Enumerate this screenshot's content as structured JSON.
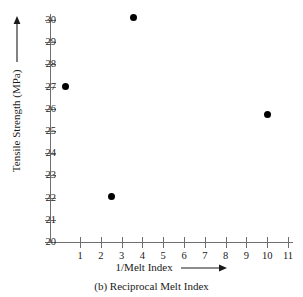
{
  "chart_data": {
    "type": "scatter",
    "title": "",
    "caption": "(b) Reciprocal Melt Index",
    "xlabel": "1/Melt Index",
    "ylabel": "Tensile Strength (MPa)",
    "xlabel_arrow": "right-arrow",
    "ylabel_arrow": "up-arrow",
    "xlim": [
      0,
      11.6
    ],
    "ylim": [
      20,
      30.4
    ],
    "xticks": [
      1,
      2,
      3,
      4,
      5,
      6,
      7,
      8,
      9,
      10,
      11
    ],
    "yticks": [
      20,
      21,
      22,
      23,
      24,
      25,
      26,
      27,
      28,
      29,
      30
    ],
    "xtick_labels": [
      "1",
      "2",
      "3",
      "4",
      "5",
      "6",
      "7",
      "8",
      "9",
      "10",
      "11"
    ],
    "ytick_labels": [
      "20",
      "21",
      "22",
      "23",
      "24",
      "25",
      "26",
      "27",
      "28",
      "29",
      "30"
    ],
    "grid": false,
    "legend": false,
    "marker": "filled-circle",
    "marker_color": "#000000",
    "axis_color": "#6f6f6f",
    "points": [
      {
        "x": 0.3,
        "y": 27.0
      },
      {
        "x": 2.5,
        "y": 22.05
      },
      {
        "x": 3.55,
        "y": 30.1
      },
      {
        "x": 10.0,
        "y": 25.75
      }
    ]
  }
}
